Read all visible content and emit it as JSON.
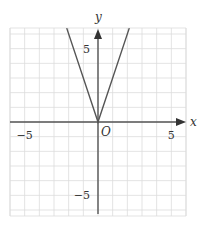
{
  "chart_data": {
    "type": "line",
    "title": "",
    "xlabel": "x",
    "ylabel": "y",
    "origin_label": "O",
    "xlim": [
      -6,
      6
    ],
    "ylim": [
      -6.4,
      6.4
    ],
    "grid": true,
    "x_ticks": [
      {
        "value": -5,
        "label": "−5"
      },
      {
        "value": 5,
        "label": "5"
      }
    ],
    "y_ticks": [
      {
        "value": 5,
        "label": "5"
      },
      {
        "value": -5,
        "label": "−5"
      }
    ],
    "series": [
      {
        "name": "y = 3|x|",
        "x": [
          -2.133,
          0,
          2.133
        ],
        "y": [
          6.4,
          0,
          6.4
        ]
      }
    ],
    "colors": {
      "grid": "#dcdcdc",
      "axis": "#555555",
      "curve": "#555555"
    }
  }
}
